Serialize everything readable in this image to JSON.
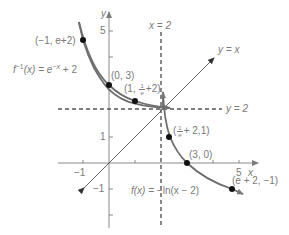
{
  "diagram": {
    "axes": {
      "x_label": "x",
      "y_label": "y",
      "x_ticks": [
        -1,
        1,
        2,
        3,
        4,
        5
      ],
      "x_tick_labels": {
        "-1": "−1",
        "5": "5"
      },
      "y_ticks": [
        -2,
        -1,
        1,
        2,
        3,
        4,
        5
      ],
      "y_tick_labels": {
        "5": "5",
        "1": "1",
        "-1": "−1"
      }
    },
    "asymptotes": {
      "vertical": {
        "label": "x = 2",
        "x": 2
      },
      "horizontal": {
        "label": "y = 2",
        "y": 2
      }
    },
    "identity_line": {
      "label": "y = x"
    },
    "functions": {
      "f": {
        "label_prefix": "f(x) = ",
        "label_body": "−ln(x − 2)"
      },
      "f_inverse": {
        "label_prefix": "f",
        "label_sup": "−1",
        "label_mid": "(x) = e",
        "label_sup2": "−x",
        "label_suffix": " + 2"
      }
    },
    "points": {
      "p1": {
        "label": "(−1, e+2)",
        "x": -1,
        "y": 4.718
      },
      "p2": {
        "label": "(0, 3)",
        "x": 0,
        "y": 3
      },
      "p3": {
        "label_pre": "(1, ",
        "frac_num": "1",
        "frac_den": "e",
        "label_post": "+2)",
        "x": 1,
        "y": 2.368
      },
      "p4": {
        "label_pre": "(",
        "frac_num": "1",
        "frac_den": "e",
        "label_post": "+ 2,1)",
        "x": 2.368,
        "y": 1
      },
      "p5": {
        "label": "(3, 0)",
        "x": 3,
        "y": 0
      },
      "p6": {
        "label": "(e + 2, −1)",
        "x": 4.718,
        "y": -1
      }
    },
    "colors": {
      "curve": "#6e6e6e",
      "axis": "#8a8a8a",
      "dashed": "#555555",
      "point": "#111111",
      "text": "#7a7a7a"
    }
  }
}
